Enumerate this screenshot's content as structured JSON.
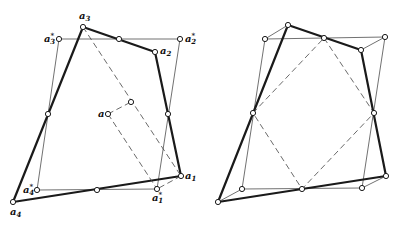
{
  "figure": {
    "left_panel": {
      "labels": {
        "a1": "a",
        "a1_sub": "1",
        "a2": "a",
        "a2_sub": "2",
        "a3": "a",
        "a3_sub": "3",
        "a4": "a",
        "a4_sub": "4",
        "a1s": "a",
        "a1s_sub": "1",
        "a1s_sup": "*",
        "a2s": "a",
        "a2s_sub": "2",
        "a2s_sup": "*",
        "a3s": "a",
        "a3s_sub": "3",
        "a3s_sup": "*",
        "a4s": "a",
        "a4s_sub": "4",
        "a4s_sup": "*",
        "center": "a"
      }
    },
    "right_panel": {
      "labels": {}
    }
  }
}
